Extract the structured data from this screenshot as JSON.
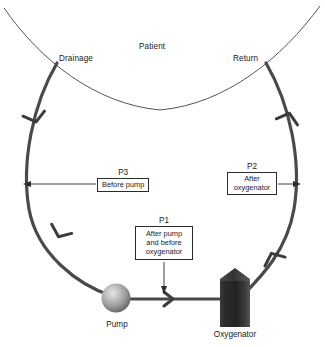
{
  "diagram": {
    "anatomy_label": "Patient",
    "cannula_labels": {
      "drainage": "Drainage",
      "return": "Return"
    },
    "equipment": [
      {
        "id": "pump",
        "label": "Pump",
        "icon": "sphere-pump-icon"
      },
      {
        "id": "oxygenator",
        "label": "Oxygenator",
        "icon": "oxygenator-box-icon"
      }
    ],
    "pressure_ports": [
      {
        "id": "p1",
        "key": "P1",
        "lines": [
          "After pump",
          "and before",
          "oxygenator"
        ],
        "pointer": "down"
      },
      {
        "id": "p2",
        "key": "P2",
        "lines": [
          "After",
          "oxygenator"
        ],
        "pointer": "right"
      },
      {
        "id": "p3",
        "key": "P3",
        "lines": [
          "Before pump"
        ],
        "pointer": "left"
      }
    ],
    "flow_markers": [
      {
        "id": "flow-drainage-upper",
        "direction": "down"
      },
      {
        "id": "flow-drainage-lower",
        "direction": "down"
      },
      {
        "id": "flow-pump-to-oxygenator",
        "direction": "right"
      },
      {
        "id": "flow-return-lower",
        "direction": "up"
      },
      {
        "id": "flow-return-upper",
        "direction": "up"
      }
    ],
    "colors": {
      "tubing": "#4a4a4a",
      "patient_arc": "#4a4a4a",
      "oxygenator_dark": "#2e2e2e",
      "oxygenator_light": "#6e6e6e",
      "pump_light": "#d8d8d8",
      "pump_dark": "#6a6a6a",
      "text": "#1a1a1a",
      "background": "#ffffff"
    }
  }
}
